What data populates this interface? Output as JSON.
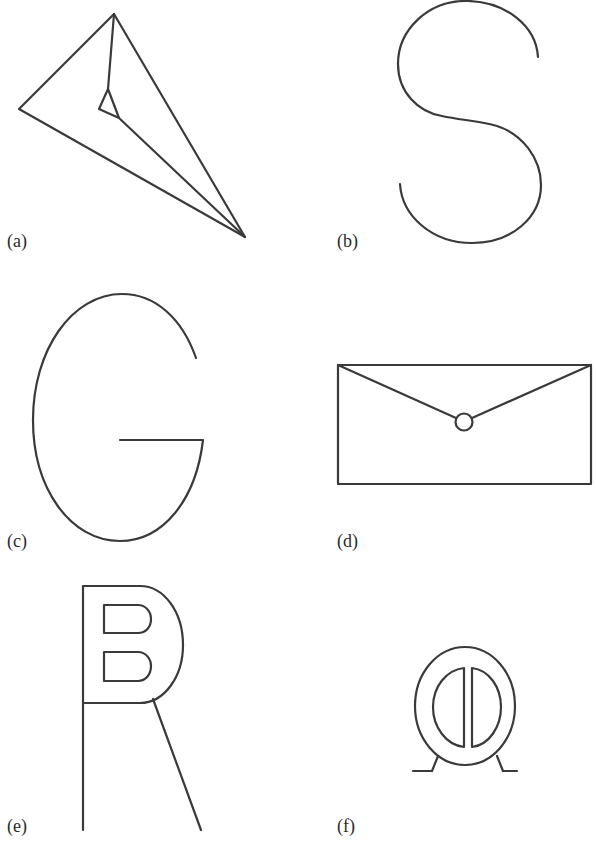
{
  "figure": {
    "panels": [
      {
        "id": "a",
        "label": "(a)",
        "subject": "paper-airplane-outline"
      },
      {
        "id": "b",
        "label": "(b)",
        "subject": "letter-S-outline"
      },
      {
        "id": "c",
        "label": "(c)",
        "subject": "letter-G-outline"
      },
      {
        "id": "d",
        "label": "(d)",
        "subject": "envelope-outline"
      },
      {
        "id": "e",
        "label": "(e)",
        "subject": "letter-R-with-B-counters-outline"
      },
      {
        "id": "f",
        "label": "(f)",
        "subject": "circular-object-on-feet-outline"
      }
    ],
    "colors": {
      "background": "#ffffff",
      "line": "#3a3a3a",
      "text": "#2b2b2b"
    }
  }
}
